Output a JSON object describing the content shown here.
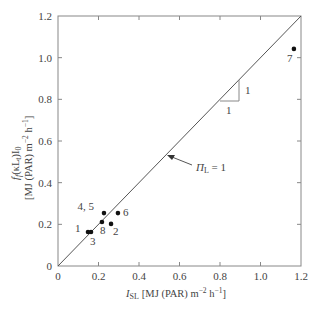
{
  "chart_data": {
    "type": "scatter",
    "title": "",
    "xlabel": {
      "symbol": "I",
      "subscript": "SL",
      "units": "[MJ (PAR) m",
      "exp1": "−2",
      "mid": " h",
      "exp2": "−1",
      "end": "]"
    },
    "ylabel": {
      "line1": "f",
      "line1_sub": "f",
      "line1_rest": "(κL",
      "line1_sub2": "t",
      "line1_rest2": ")I",
      "line1_sub3": "0",
      "line2": "[MJ (PAR) m",
      "exp1": "−2",
      "mid": " h",
      "exp2": "−1",
      "end": "]"
    },
    "xlim": [
      0,
      1.2
    ],
    "ylim": [
      0,
      1.2
    ],
    "x_ticks": [
      "0",
      "0.2",
      "0.4",
      "0.6",
      "0.8",
      "1.0",
      "1.2"
    ],
    "y_ticks": [
      "0",
      "0.2",
      "0.4",
      "0.6",
      "0.8",
      "1.0",
      "1.2"
    ],
    "grid": false,
    "points": [
      {
        "label": "1",
        "x": 0.148,
        "y": 0.163
      },
      {
        "label": "3",
        "x": 0.163,
        "y": 0.163
      },
      {
        "label": "8",
        "x": 0.217,
        "y": 0.211
      },
      {
        "label": "4, 5",
        "x": 0.227,
        "y": 0.254
      },
      {
        "label": "2",
        "x": 0.262,
        "y": 0.202
      },
      {
        "label": "6",
        "x": 0.296,
        "y": 0.254
      },
      {
        "label": "7",
        "x": 1.165,
        "y": 1.042
      }
    ],
    "reference_line": {
      "name": "1:1 line",
      "x": [
        0,
        1.2
      ],
      "y": [
        0,
        1.2
      ],
      "annotation": "Π",
      "annotation_sub": "L",
      "annotation_rest": " = 1"
    },
    "slope_triangle": {
      "run_label": "1",
      "rise_label": "1"
    },
    "legend": "none"
  },
  "colors": {
    "axis": "#888888",
    "line": "#555555",
    "point": "#111111",
    "text": "#444444"
  }
}
